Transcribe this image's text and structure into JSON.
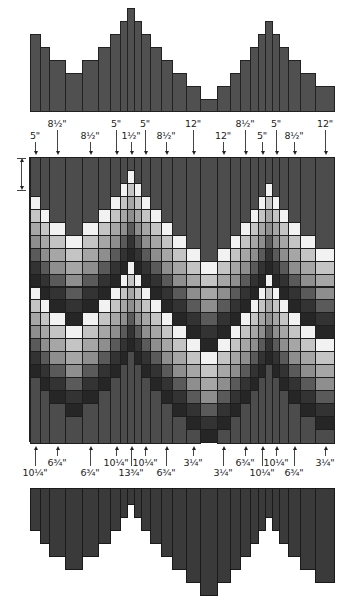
{
  "diagram": {
    "type": "quilt-strip-layout",
    "shades": [
      "#f2f2f2",
      "#c4c4c4",
      "#a6a6a6",
      "#8e8e8e",
      "#5a5a5a",
      "#333333",
      "#262626"
    ],
    "filler_color": "#4c4c4c",
    "bar_color_top": "#505050",
    "bar_color_bottom": "#3a3a3a",
    "column_edges": [
      30,
      40,
      49,
      65,
      82,
      98,
      110,
      120,
      127,
      134,
      141,
      150,
      161,
      172,
      186,
      200,
      217,
      230,
      240,
      250,
      258,
      265,
      272,
      279,
      288,
      300,
      315,
      334
    ],
    "top_filler_rows": [
      3,
      4,
      5,
      6,
      5,
      4,
      3,
      2,
      1,
      2,
      3,
      4,
      5,
      6,
      7,
      8,
      7,
      6,
      5,
      4,
      3,
      2,
      3,
      4,
      5,
      6,
      7
    ],
    "top_labels": [
      {
        "text": "5\"",
        "x": 35,
        "row": 0
      },
      {
        "text": "8½\"",
        "x": 57,
        "row": 1
      },
      {
        "text": "8½\"",
        "x": 90,
        "row": 0
      },
      {
        "text": "5\"",
        "x": 116,
        "row": 1
      },
      {
        "text": "1½\"",
        "x": 131,
        "row": 0
      },
      {
        "text": "5\"",
        "x": 145,
        "row": 1
      },
      {
        "text": "8½\"",
        "x": 166,
        "row": 0
      },
      {
        "text": "12\"",
        "x": 193,
        "row": 1
      },
      {
        "text": "12\"",
        "x": 223,
        "row": 0
      },
      {
        "text": "8½\"",
        "x": 245,
        "row": 1
      },
      {
        "text": "5\"",
        "x": 262,
        "row": 0
      },
      {
        "text": "5\"",
        "x": 276,
        "row": 1
      },
      {
        "text": "8½\"",
        "x": 294,
        "row": 0
      },
      {
        "text": "12\"",
        "x": 325,
        "row": 1
      }
    ],
    "bottom_labels": [
      {
        "text": "10¼\"",
        "x": 35,
        "row": 1
      },
      {
        "text": "6¾\"",
        "x": 57,
        "row": 0
      },
      {
        "text": "6¾\"",
        "x": 90,
        "row": 1
      },
      {
        "text": "10¼\"",
        "x": 116,
        "row": 0
      },
      {
        "text": "13¾\"",
        "x": 131,
        "row": 1
      },
      {
        "text": "10¼\"",
        "x": 145,
        "row": 0
      },
      {
        "text": "6¾\"",
        "x": 166,
        "row": 1
      },
      {
        "text": "3¼\"",
        "x": 193,
        "row": 0
      },
      {
        "text": "3¼\"",
        "x": 223,
        "row": 1
      },
      {
        "text": "6¾\"",
        "x": 245,
        "row": 0
      },
      {
        "text": "10¼\"",
        "x": 262,
        "row": 1
      },
      {
        "text": "10¼\"",
        "x": 276,
        "row": 0
      },
      {
        "text": "6¾\"",
        "x": 294,
        "row": 1
      },
      {
        "text": "3¼\"",
        "x": 325,
        "row": 0
      }
    ]
  },
  "chart_data": [
    {
      "type": "bar",
      "title": "Top filler profile",
      "categories": [
        "c1",
        "c2",
        "c3",
        "c4",
        "c5",
        "c6",
        "c7",
        "c8",
        "c9",
        "c10",
        "c11",
        "c12",
        "c13",
        "c14",
        "c15",
        "c16",
        "c17",
        "c18",
        "c19",
        "c20",
        "c21",
        "c22",
        "c23",
        "c24",
        "c25",
        "c26",
        "c27"
      ],
      "values": [
        5,
        4,
        3,
        2,
        3,
        4,
        5,
        6,
        7,
        6,
        5,
        4,
        3,
        2,
        1,
        0,
        1,
        2,
        3,
        4,
        5,
        6,
        5,
        4,
        3,
        2,
        1
      ],
      "xlabel": "",
      "ylabel": "",
      "grid": false
    },
    {
      "type": "bar",
      "title": "Bottom filler profile (inverted)",
      "categories": [
        "c1",
        "c2",
        "c3",
        "c4",
        "c5",
        "c6",
        "c7",
        "c8",
        "c9",
        "c10",
        "c11",
        "c12",
        "c13",
        "c14",
        "c15",
        "c16",
        "c17",
        "c18",
        "c19",
        "c20",
        "c21",
        "c22",
        "c23",
        "c24",
        "c25",
        "c26",
        "c27"
      ],
      "values": [
        3,
        4,
        5,
        6,
        5,
        4,
        3,
        2,
        1,
        2,
        3,
        4,
        5,
        6,
        7,
        8,
        7,
        6,
        5,
        4,
        3,
        2,
        3,
        4,
        5,
        6,
        7
      ],
      "xlabel": "",
      "ylabel": "",
      "grid": false
    }
  ]
}
